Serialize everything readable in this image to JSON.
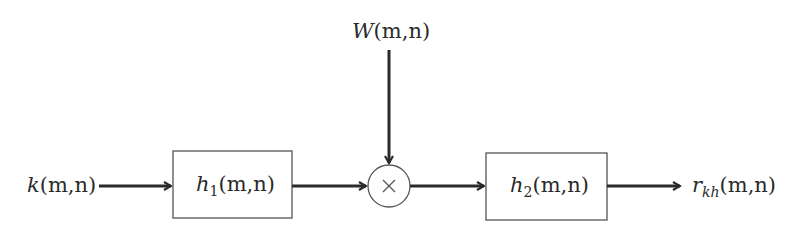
{
  "diagram": {
    "type": "block-diagram",
    "input": {
      "func": "k",
      "args": "(m,n)"
    },
    "multiplier_input": {
      "func": "W",
      "args": "(m,n)"
    },
    "multiplier_symbol": "×",
    "blocks": [
      {
        "func": "h",
        "sub": "1",
        "args": "(m,n)"
      },
      {
        "func": "h",
        "sub": "2",
        "args": "(m,n)"
      }
    ],
    "output": {
      "func": "r",
      "sub": "kh",
      "args": "(m,n)"
    },
    "colors": {
      "stroke": "#2a2a2a",
      "box_stroke": "#555555",
      "background": "#ffffff"
    }
  }
}
